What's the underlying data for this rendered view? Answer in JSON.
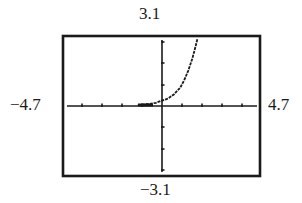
{
  "chart_data": {
    "type": "line",
    "title": "",
    "xlabel": "",
    "ylabel": "",
    "xlim": [
      -4.7,
      4.7
    ],
    "ylim": [
      -3.1,
      3.1
    ],
    "x_tick_step": 1,
    "y_tick_step": 1,
    "grid": false,
    "legend": null,
    "window_labels": {
      "ymax": "3.1",
      "ymin": "−3.1",
      "xmin": "−4.7",
      "xmax": "4.7"
    },
    "series": [
      {
        "name": "curve",
        "description": "increasing exponential-like curve, near 0 for negative x, rising steeply for x > 1",
        "x": [
          -1.2,
          -1.0,
          -0.6,
          -0.3,
          0.0,
          0.3,
          0.6,
          0.9,
          1.1,
          1.3,
          1.5,
          1.7,
          1.75
        ],
        "y": [
          0.04,
          0.06,
          0.1,
          0.15,
          0.25,
          0.35,
          0.55,
          0.85,
          1.2,
          1.65,
          2.2,
          2.9,
          3.1
        ]
      }
    ]
  },
  "frame": {
    "left": 63,
    "top": 36,
    "right": 260,
    "bottom": 176,
    "stroke_color": "#1a1a1a"
  },
  "axes": {
    "origin_px": [
      162,
      106
    ],
    "px_per_unit_x": 20.2,
    "px_per_unit_y": 21.5,
    "x_ticks_px": [
      82,
      102,
      122,
      142,
      182,
      202,
      222,
      242
    ],
    "y_ticks_px": [
      42,
      63,
      85,
      127,
      149,
      170
    ]
  }
}
